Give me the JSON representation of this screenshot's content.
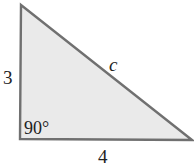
{
  "diagram": {
    "type": "right-triangle",
    "colors": {
      "fill": "#eaeaea",
      "stroke": "#707070",
      "text": "#222222"
    },
    "vertices": {
      "top": [
        21,
        5
      ],
      "right_angle": [
        20,
        139
      ],
      "bottom_right": [
        192,
        140
      ]
    },
    "labels": {
      "left_side": "3",
      "bottom_side": "4",
      "hypotenuse": "c",
      "angle": "90°"
    }
  }
}
